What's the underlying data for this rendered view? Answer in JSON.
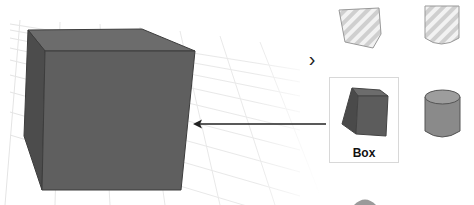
{
  "viewport": {
    "object": "cube",
    "colors": {
      "front": "#5e5e5e",
      "top": "#6e6e6e",
      "side": "#4a4a4a",
      "edge": "#3a3a3a",
      "grid": "#e6e6e6"
    }
  },
  "panel": {
    "nav_chevron": "›",
    "shapes": [
      {
        "name": "box-textured",
        "label": ""
      },
      {
        "name": "cylinder-textured",
        "label": ""
      },
      {
        "name": "box",
        "label": "Box",
        "selected": true
      },
      {
        "name": "cylinder",
        "label": ""
      },
      {
        "name": "sphere",
        "label": ""
      }
    ],
    "selected_label": "Box"
  },
  "annotation": {
    "arrow": "points from Box card to cube in viewport"
  }
}
